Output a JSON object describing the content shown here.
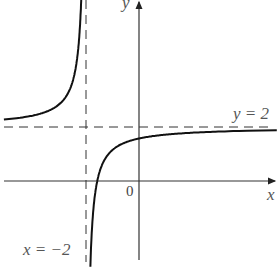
{
  "chart_data": {
    "type": "line",
    "title": "",
    "function": "y = 2 - 0.85/(x + 2)",
    "xlabel": "x",
    "ylabel": "y",
    "origin_label": "0",
    "asymptotes": [
      {
        "type": "vertical",
        "value": -2,
        "label": "x = −2",
        "style": "dashed"
      },
      {
        "type": "horizontal",
        "value": 2,
        "label": "y = 2",
        "style": "dashed"
      }
    ],
    "series": [
      {
        "name": "left branch",
        "x_range": [
          -5.1,
          -2.03
        ]
      },
      {
        "name": "right branch",
        "x_range": [
          -1.95,
          5.2
        ]
      }
    ],
    "xlim": [
      -5.2,
      5.2
    ],
    "ylim": [
      -3.5,
      6.8
    ],
    "grid": false,
    "legend": "none"
  },
  "labels": {
    "x_axis": "x",
    "y_axis": "y",
    "origin": "0",
    "h_asymptote": "y = 2",
    "v_asymptote": "x = −2"
  }
}
